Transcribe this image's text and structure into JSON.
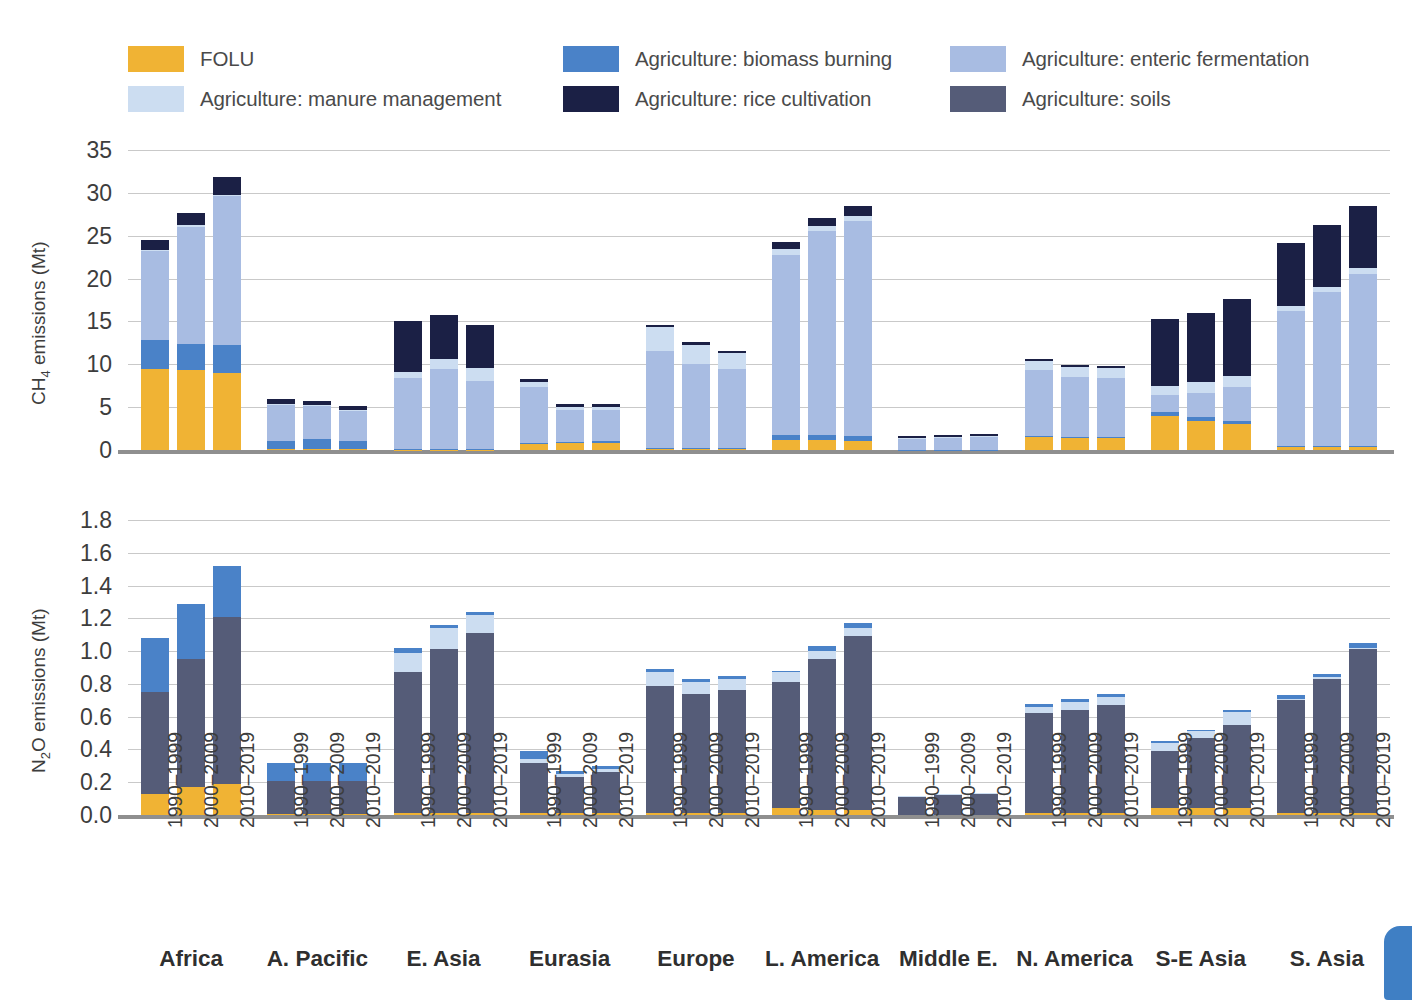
{
  "legend": {
    "items": [
      {
        "label": "FOLU",
        "key": "folu",
        "color": "#F0B334",
        "x": 128,
        "y": 0
      },
      {
        "label": "Agriculture: biomass burning",
        "key": "biomass",
        "color": "#4A82C8",
        "x": 563,
        "y": 0
      },
      {
        "label": "Agriculture: enteric fermentation",
        "key": "enteric",
        "color": "#A8BCE2",
        "x": 950,
        "y": 0
      },
      {
        "label": "Agriculture: manure management",
        "key": "manure",
        "color": "#CCDDF1",
        "x": 128,
        "y": 40
      },
      {
        "label": "Agriculture: rice cultivation",
        "key": "rice",
        "color": "#1B2045",
        "x": 563,
        "y": 40
      },
      {
        "label": "Agriculture: soils",
        "key": "soils",
        "color": "#555C78",
        "x": 950,
        "y": 40
      }
    ]
  },
  "chart_data": [
    {
      "type": "bar",
      "subtype": "stacked-grouped",
      "title": "",
      "ylabel": "CH₄ emissions (Mt)",
      "xlabel": "",
      "ylim": [
        0,
        35
      ],
      "yticks": [
        0,
        5,
        10,
        15,
        20,
        25,
        30,
        35
      ],
      "ytick_labels": [
        "0",
        "5",
        "10",
        "15",
        "20",
        "25",
        "30",
        "35"
      ],
      "grid": true,
      "legend_position": "top",
      "periods": [
        "1990–1999",
        "2000–2009",
        "2010–2019"
      ],
      "categories": [
        "Africa",
        "A. Pacific",
        "E. Asia",
        "Eurasia",
        "Europe",
        "L. America",
        "Middle E.",
        "N. America",
        "S-E Asia",
        "S. Asia"
      ],
      "stack_order": [
        "folu",
        "biomass",
        "enteric",
        "manure",
        "rice",
        "soils"
      ],
      "series": [
        {
          "name": "FOLU",
          "key": "folu",
          "color": "#F0B334",
          "values": [
            [
              9.5,
              9.3,
              9.0
            ],
            [
              0.1,
              0.1,
              0.1
            ],
            [
              0.05,
              0.05,
              0.05
            ],
            [
              0.7,
              0.8,
              0.9
            ],
            [
              0.1,
              0.1,
              0.1
            ],
            [
              1.2,
              1.2,
              1.1
            ],
            [
              0.0,
              0.0,
              0.0
            ],
            [
              1.5,
              1.4,
              1.4
            ],
            [
              4.0,
              3.4,
              3.0
            ],
            [
              0.3,
              0.3,
              0.3
            ]
          ]
        },
        {
          "name": "Agriculture: biomass burning",
          "key": "biomass",
          "color": "#4A82C8",
          "values": [
            [
              3.3,
              3.1,
              3.3
            ],
            [
              0.9,
              1.2,
              0.9
            ],
            [
              0.1,
              0.1,
              0.1
            ],
            [
              0.1,
              0.1,
              0.1
            ],
            [
              0.1,
              0.1,
              0.1
            ],
            [
              0.6,
              0.6,
              0.5
            ],
            [
              0.05,
              0.05,
              0.05
            ],
            [
              0.1,
              0.1,
              0.1
            ],
            [
              0.4,
              0.4,
              0.4
            ],
            [
              0.2,
              0.2,
              0.2
            ]
          ]
        },
        {
          "name": "Agriculture: enteric fermentation",
          "key": "enteric",
          "color": "#A8BCE2",
          "values": [
            [
              10.4,
              13.7,
              17.3
            ],
            [
              4.2,
              3.8,
              3.5
            ],
            [
              8.2,
              9.3,
              7.9
            ],
            [
              6.6,
              3.8,
              3.7
            ],
            [
              11.3,
              9.8,
              9.2
            ],
            [
              21.0,
              23.7,
              25.1
            ],
            [
              1.3,
              1.4,
              1.5
            ],
            [
              7.7,
              7.0,
              6.9
            ],
            [
              2.0,
              2.9,
              3.9
            ],
            [
              15.7,
              17.9,
              20.0
            ]
          ]
        },
        {
          "name": "Agriculture: manure management",
          "key": "manure",
          "color": "#CCDDF1",
          "values": [
            [
              0.1,
              0.1,
              0.2
            ],
            [
              0.2,
              0.2,
              0.2
            ],
            [
              0.7,
              1.2,
              1.5
            ],
            [
              0.5,
              0.3,
              0.3
            ],
            [
              2.8,
              2.3,
              1.9
            ],
            [
              0.6,
              0.6,
              0.6
            ],
            [
              0.1,
              0.1,
              0.1
            ],
            [
              1.1,
              1.2,
              1.2
            ],
            [
              1.1,
              1.2,
              1.3
            ],
            [
              0.6,
              0.6,
              0.7
            ]
          ]
        },
        {
          "name": "Agriculture: rice cultivation",
          "key": "rice",
          "color": "#1B2045",
          "values": [
            [
              1.2,
              1.5,
              2.1
            ],
            [
              0.5,
              0.4,
              0.4
            ],
            [
              6.0,
              5.1,
              5.0
            ],
            [
              0.4,
              0.4,
              0.4
            ],
            [
              0.3,
              0.3,
              0.3
            ],
            [
              0.9,
              1.0,
              1.2
            ],
            [
              0.2,
              0.2,
              0.2
            ],
            [
              0.2,
              0.2,
              0.2
            ],
            [
              7.8,
              8.1,
              9.0
            ],
            [
              7.3,
              7.2,
              7.3
            ]
          ]
        },
        {
          "name": "Agriculture: soils",
          "key": "soils",
          "color": "#555C78",
          "values": [
            [
              0,
              0,
              0
            ],
            [
              0,
              0,
              0
            ],
            [
              0,
              0,
              0
            ],
            [
              0,
              0,
              0
            ],
            [
              0,
              0,
              0
            ],
            [
              0,
              0,
              0
            ],
            [
              0,
              0,
              0
            ],
            [
              0,
              0,
              0
            ],
            [
              0,
              0,
              0
            ],
            [
              0,
              0,
              0
            ]
          ]
        }
      ],
      "totals": [
        [
          24.5,
          27.7,
          31.9
        ],
        [
          5.9,
          5.7,
          5.1
        ],
        [
          15.05,
          15.75,
          14.55
        ],
        [
          8.3,
          5.4,
          5.4
        ],
        [
          14.6,
          12.6,
          11.6
        ],
        [
          24.3,
          27.1,
          28.5
        ],
        [
          1.65,
          1.75,
          1.85
        ],
        [
          10.6,
          9.9,
          9.8
        ],
        [
          15.3,
          16.0,
          17.6
        ],
        [
          24.1,
          26.2,
          28.5
        ]
      ]
    },
    {
      "type": "bar",
      "subtype": "stacked-grouped",
      "title": "",
      "ylabel": "N₂O emissions (Mt)",
      "xlabel": "",
      "ylim": [
        0,
        1.8
      ],
      "yticks": [
        0.0,
        0.2,
        0.4,
        0.6,
        0.8,
        1.0,
        1.2,
        1.4,
        1.6,
        1.8
      ],
      "ytick_labels": [
        "0.0",
        "0.2",
        "0.4",
        "0.6",
        "0.8",
        "1.0",
        "1.2",
        "1.4",
        "1.6",
        "1.8"
      ],
      "grid": true,
      "legend_position": "top",
      "periods": [
        "1990–1999",
        "2000–2009",
        "2010–2019"
      ],
      "categories": [
        "Africa",
        "A. Pacific",
        "E. Asia",
        "Eurasia",
        "Europe",
        "L. America",
        "Middle E.",
        "N. America",
        "S-E Asia",
        "S. Asia"
      ],
      "stack_order": [
        "folu",
        "soils",
        "manure",
        "biomass"
      ],
      "series": [
        {
          "name": "FOLU",
          "key": "folu",
          "color": "#F0B334",
          "values": [
            [
              0.13,
              0.17,
              0.19
            ],
            [
              0.005,
              0.005,
              0.005
            ],
            [
              0.01,
              0.01,
              0.01
            ],
            [
              0.01,
              0.01,
              0.01
            ],
            [
              0.01,
              0.01,
              0.01
            ],
            [
              0.04,
              0.03,
              0.03
            ],
            [
              0.0,
              0.0,
              0.0
            ],
            [
              0.01,
              0.01,
              0.01
            ],
            [
              0.04,
              0.04,
              0.04
            ],
            [
              0.01,
              0.01,
              0.01
            ]
          ]
        },
        {
          "name": "Agriculture: soils",
          "key": "soils",
          "color": "#555C78",
          "values": [
            [
              0.62,
              0.78,
              1.02
            ],
            [
              0.205,
              0.205,
              0.205
            ],
            [
              0.86,
              1.0,
              1.1
            ],
            [
              0.31,
              0.22,
              0.25
            ],
            [
              0.78,
              0.73,
              0.75
            ],
            [
              0.77,
              0.92,
              1.06
            ],
            [
              0.11,
              0.125,
              0.13
            ],
            [
              0.61,
              0.63,
              0.66
            ],
            [
              0.35,
              0.43,
              0.51
            ],
            [
              0.69,
              0.82,
              1.0
            ]
          ]
        },
        {
          "name": "Agriculture: manure management",
          "key": "manure",
          "color": "#CCDDF1",
          "values": [
            [
              0.0,
              0.0,
              0.0
            ],
            [
              0.0,
              0.0,
              0.0
            ],
            [
              0.12,
              0.13,
              0.11
            ],
            [
              0.02,
              0.02,
              0.02
            ],
            [
              0.08,
              0.07,
              0.07
            ],
            [
              0.06,
              0.05,
              0.05
            ],
            [
              0.005,
              0.005,
              0.005
            ],
            [
              0.04,
              0.05,
              0.05
            ],
            [
              0.05,
              0.04,
              0.08
            ],
            [
              0.01,
              0.01,
              0.01
            ]
          ]
        },
        {
          "name": "Agriculture: biomass burning",
          "key": "biomass",
          "color": "#4A82C8",
          "values": [
            [
              0.33,
              0.34,
              0.31
            ],
            [
              0.11,
              0.11,
              0.105
            ],
            [
              0.03,
              0.02,
              0.02
            ],
            [
              0.05,
              0.02,
              0.02
            ],
            [
              0.02,
              0.02,
              0.02
            ],
            [
              0.01,
              0.03,
              0.03
            ],
            [
              0.0,
              0.0,
              0.0
            ],
            [
              0.02,
              0.02,
              0.02
            ],
            [
              0.01,
              0.01,
              0.01
            ],
            [
              0.02,
              0.02,
              0.03
            ]
          ]
        }
      ],
      "totals": [
        [
          1.08,
          1.29,
          1.52
        ],
        [
          0.32,
          0.32,
          0.315
        ],
        [
          1.02,
          1.16,
          1.24
        ],
        [
          0.39,
          0.27,
          0.3
        ],
        [
          0.89,
          0.83,
          0.85
        ],
        [
          0.88,
          1.03,
          1.17
        ],
        [
          0.115,
          0.13,
          0.135
        ],
        [
          0.68,
          0.71,
          0.74
        ],
        [
          0.45,
          0.52,
          0.64
        ],
        [
          0.73,
          0.86,
          1.05
        ]
      ]
    }
  ]
}
